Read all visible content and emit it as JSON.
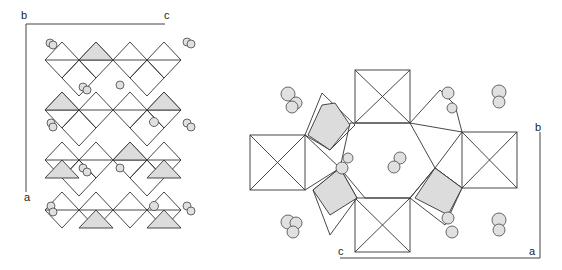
{
  "figure": {
    "type": "crystal-structure-polyhedral-projection",
    "left_panel": {
      "view": "projection along b",
      "axis_labels": {
        "origin": "b",
        "horizontal": "c",
        "vertical": "a"
      }
    },
    "right_panel": {
      "view": "projection along a",
      "axis_labels": {
        "vertical": "b",
        "horizontal_left": "c",
        "corner": "a"
      }
    },
    "colors": {
      "line": "#333333",
      "shaded_polyhedra": "#dcdcdc",
      "atom_fill": "#e0e0e0",
      "background": "#ffffff"
    }
  }
}
